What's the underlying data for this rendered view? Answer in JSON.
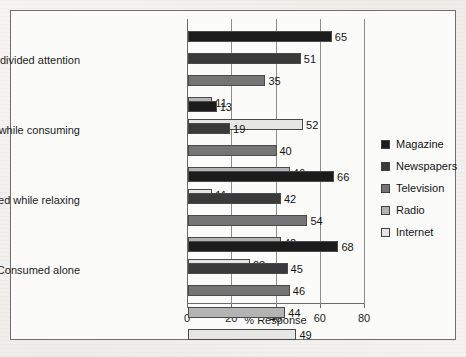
{
  "chart_data": {
    "type": "bar",
    "orientation": "horizontal",
    "title": "",
    "xlabel": "% Response",
    "ylabel": "",
    "xlim": [
      0,
      80
    ],
    "xticks": [
      0,
      20,
      40,
      60,
      80
    ],
    "grid": true,
    "legend_position": "right",
    "categories": [
      "Give undivided attention",
      "Do other things while consuming",
      "Consumed while relaxing",
      "Consumed alone"
    ],
    "series": [
      {
        "name": "Magazine",
        "color": "#1c1c1c",
        "values": [
          65,
          13,
          66,
          68
        ]
      },
      {
        "name": "Newspapers",
        "color": "#3a3a3a",
        "values": [
          51,
          19,
          42,
          45
        ]
      },
      {
        "name": "Television",
        "color": "#757575",
        "values": [
          35,
          40,
          54,
          46
        ]
      },
      {
        "name": "Radio",
        "color": "#b3b3b3",
        "values": [
          11,
          46,
          42,
          44
        ]
      },
      {
        "name": "Internet",
        "color": "#e6e6e4",
        "values": [
          52,
          11,
          28,
          49
        ]
      }
    ]
  },
  "legend": {
    "items": [
      {
        "label": "Magazine"
      },
      {
        "label": "Newspapers"
      },
      {
        "label": "Television"
      },
      {
        "label": "Radio"
      },
      {
        "label": "Internet"
      }
    ]
  }
}
